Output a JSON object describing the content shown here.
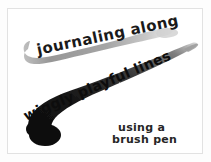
{
  "artwork": {
    "title_line_1": "journaling along",
    "title_line_2": "wiggly playful lines",
    "caption_line_1": "using a",
    "caption_line_2": "brush pen",
    "medium_note": "brush pen",
    "background_color": "#ffffff",
    "frame_border_color": "#e2e2e2",
    "ink_color_light": "#9a9a9a",
    "ink_color_dark": "#1a1a1a",
    "text_color": "#1a1a1a"
  },
  "strokes": {
    "upper": {
      "name": "upper-brush-stroke",
      "color": "#9d9d9d",
      "description": "hooked tapering brush stroke curving up to the right"
    },
    "lower": {
      "name": "lower-brush-stroke",
      "color": "#141414",
      "description": "thick blunt brush stroke tapering to a fine point at upper right"
    }
  }
}
